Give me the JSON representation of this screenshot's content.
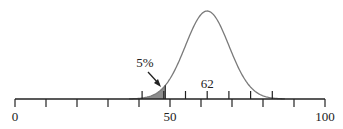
{
  "chart_data": {
    "type": "area",
    "title": "",
    "mean": 62,
    "mean_label": "62",
    "shaded_tail_label": "5%",
    "shaded_tail_upper_bound": 48.5,
    "axis": {
      "min": 0,
      "max": 100,
      "tick_labels": [
        "0",
        "50",
        "100"
      ],
      "lower_ticks": [
        0,
        10,
        20,
        30,
        40,
        50,
        60,
        70,
        80,
        90,
        100
      ],
      "upper_ticks": [
        41,
        48,
        55,
        62,
        69,
        76,
        83
      ]
    },
    "std_dev": 7,
    "colors": {
      "curve": "#7a7a7a",
      "shade": "#8c8c8c",
      "axis": "#222222"
    },
    "grid": false,
    "legend": null
  }
}
